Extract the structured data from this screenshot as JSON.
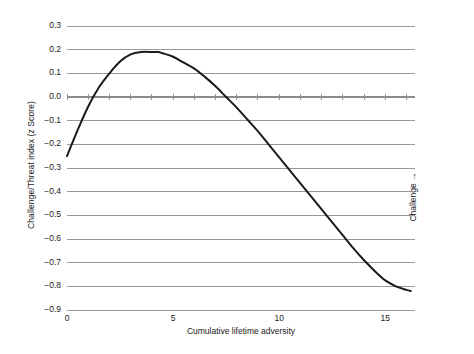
{
  "chart_data": {
    "type": "line",
    "title": "",
    "xlabel": "Cumulative lifetime adversity",
    "ylabel": "Challenge/Threat index (z Score)",
    "right_axis_label": "Challenge →",
    "xlim": [
      0,
      16.4
    ],
    "ylim": [
      -0.9,
      0.3
    ],
    "grid": true,
    "legend": null,
    "xticks": [
      0,
      5,
      10,
      15
    ],
    "xtick_labels": [
      "0",
      "5",
      "10",
      "15"
    ],
    "xminor_tick_step": 1,
    "yticks": [
      0.3,
      0.2,
      0.1,
      0.0,
      -0.1,
      -0.2,
      -0.3,
      -0.4,
      -0.5,
      -0.6,
      -0.7,
      -0.8,
      -0.9
    ],
    "ytick_labels": [
      "0.3",
      "0.2",
      "0.1",
      "0.0",
      "−0.1",
      "−0.2",
      "−0.3",
      "−0.4",
      "−0.5",
      "−0.6",
      "−0.7",
      "−0.8",
      "−0.9"
    ],
    "series": [
      {
        "name": "Challenge/Threat index",
        "color": "#1a1a1a",
        "line_width": 2,
        "x": [
          0,
          0.5,
          1.0,
          1.5,
          2.0,
          2.5,
          3.0,
          3.5,
          4.0,
          4.3,
          4.5,
          5.0,
          5.5,
          6.0,
          6.5,
          7.0,
          7.5,
          8.0,
          8.5,
          9.0,
          9.5,
          10.0,
          10.5,
          11.0,
          11.5,
          12.0,
          12.5,
          13.0,
          13.5,
          14.0,
          14.5,
          15.0,
          15.5,
          16.0,
          16.2
        ],
        "y": [
          -0.25,
          -0.14,
          -0.04,
          0.04,
          0.1,
          0.15,
          0.18,
          0.19,
          0.19,
          0.19,
          0.185,
          0.17,
          0.145,
          0.12,
          0.085,
          0.045,
          0.0,
          -0.045,
          -0.095,
          -0.145,
          -0.2,
          -0.255,
          -0.31,
          -0.365,
          -0.42,
          -0.475,
          -0.53,
          -0.585,
          -0.64,
          -0.69,
          -0.735,
          -0.775,
          -0.8,
          -0.815,
          -0.82
        ]
      }
    ],
    "annotations": {
      "peak_value": 0.19,
      "peak_x": 4.3,
      "start_value": -0.25,
      "end_value": -0.82,
      "zero_crossing_left": 1.0,
      "zero_crossing_right": 7.5
    },
    "colors": {
      "curve": "#1a1a1a",
      "grid": "#8c8c8c",
      "text": "#1a1a1a",
      "background": "#ffffff"
    }
  }
}
